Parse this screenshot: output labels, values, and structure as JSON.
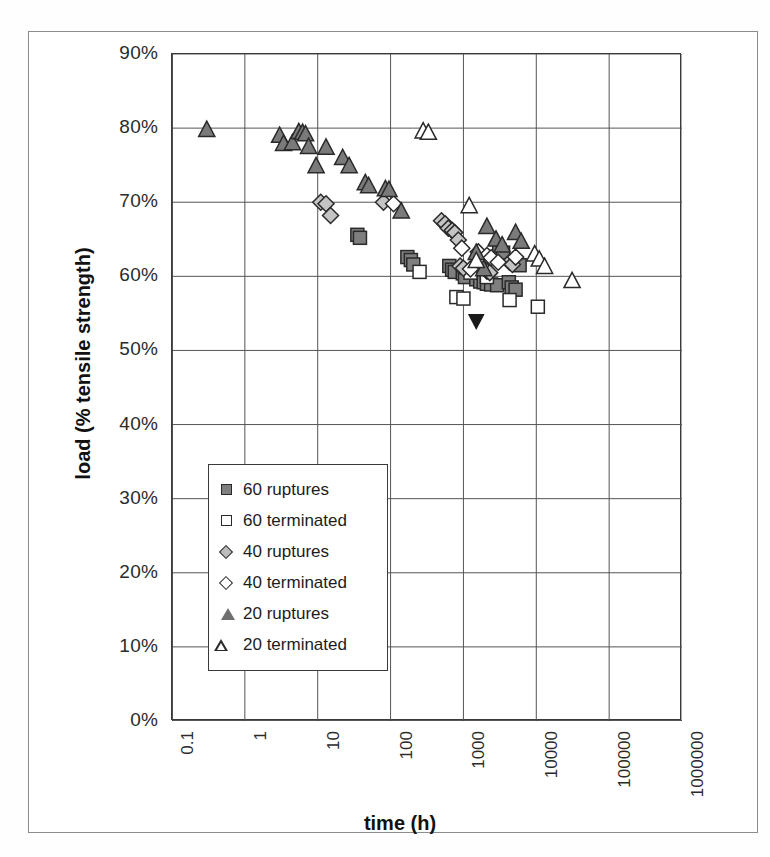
{
  "chart_data": {
    "type": "scatter",
    "title": "",
    "xlabel": "time (h)",
    "ylabel": "load (% tensile strength)",
    "xscale": "log",
    "yscale": "linear",
    "xlim": [
      0.1,
      1000000
    ],
    "ylim": [
      0,
      0.9
    ],
    "grid": true,
    "legend_position": "inside-left-lower",
    "xticklabels": [
      "0.1",
      "1",
      "10",
      "100",
      "1000",
      "10000",
      "100000",
      "1000000"
    ],
    "xtickvalues": [
      0.1,
      1,
      10,
      100,
      1000,
      10000,
      100000,
      1000000
    ],
    "yticklabels": [
      "0%",
      "10%",
      "20%",
      "30%",
      "40%",
      "50%",
      "60%",
      "70%",
      "80%",
      "90%"
    ],
    "ytickvalues": [
      0,
      10,
      20,
      30,
      40,
      50,
      60,
      70,
      80,
      90
    ],
    "series": [
      {
        "name": "60 ruptures",
        "marker": "square-filled",
        "color": "#7f7f7f",
        "edge": "#2a2a2a",
        "points": [
          [
            35,
            65.6
          ],
          [
            38,
            65.2
          ],
          [
            170,
            62.6
          ],
          [
            190,
            62.2
          ],
          [
            205,
            61.6
          ],
          [
            640,
            61.4
          ],
          [
            700,
            60.9
          ],
          [
            760,
            60.6
          ],
          [
            980,
            60.4
          ],
          [
            1050,
            59.9
          ],
          [
            1500,
            59.6
          ],
          [
            1700,
            59.3
          ],
          [
            1900,
            59.2
          ],
          [
            2100,
            59.0
          ],
          [
            2400,
            58.9
          ],
          [
            2900,
            58.8
          ],
          [
            4200,
            59.2
          ],
          [
            4600,
            58.5
          ],
          [
            5200,
            58.2
          ],
          [
            3100,
            63.6
          ],
          [
            3500,
            63.2
          ],
          [
            5300,
            61.8
          ],
          [
            5900,
            61.5
          ]
        ]
      },
      {
        "name": "60 terminated",
        "marker": "square-open",
        "color": "#ffffff",
        "edge": "#2a2a2a",
        "points": [
          [
            250,
            60.6
          ],
          [
            800,
            57.2
          ],
          [
            1000,
            57.0
          ],
          [
            1250,
            60.5
          ],
          [
            2100,
            59.9
          ],
          [
            4300,
            56.8
          ],
          [
            10500,
            55.9
          ]
        ]
      },
      {
        "name": "40 ruptures",
        "marker": "diamond-filled",
        "color": "#c4c4c4",
        "edge": "#2a2a2a",
        "points": [
          [
            11,
            70.0
          ],
          [
            13,
            69.8
          ],
          [
            15,
            68.2
          ],
          [
            80,
            70.0
          ],
          [
            500,
            67.5
          ],
          [
            560,
            67.1
          ],
          [
            620,
            66.5
          ],
          [
            700,
            66.2
          ],
          [
            760,
            65.9
          ],
          [
            850,
            64.9
          ],
          [
            900,
            61.4
          ],
          [
            1000,
            61.1
          ],
          [
            2100,
            60.7
          ],
          [
            2300,
            60.5
          ],
          [
            4300,
            61.9
          ],
          [
            4700,
            61.6
          ]
        ]
      },
      {
        "name": "40 terminated",
        "marker": "diamond-open",
        "color": "#ffffff",
        "edge": "#2a2a2a",
        "points": [
          [
            110,
            69.8
          ],
          [
            950,
            63.8
          ],
          [
            1600,
            63.3
          ],
          [
            2100,
            62.8
          ],
          [
            2400,
            62.5
          ],
          [
            3000,
            61.9
          ],
          [
            1250,
            61.0
          ],
          [
            5200,
            62.6
          ]
        ]
      },
      {
        "name": "20 ruptures",
        "marker": "triangle-filled",
        "color": "#7a7a7a",
        "edge": "#2a2a2a",
        "points": [
          [
            0.3,
            79.8
          ],
          [
            3.0,
            79.0
          ],
          [
            3.4,
            77.9
          ],
          [
            4.5,
            78.0
          ],
          [
            5.5,
            79.5
          ],
          [
            6.2,
            79.4
          ],
          [
            6.8,
            79.2
          ],
          [
            7.5,
            77.5
          ],
          [
            9.5,
            74.9
          ],
          [
            13,
            77.4
          ],
          [
            22,
            76.0
          ],
          [
            27,
            74.9
          ],
          [
            45,
            72.6
          ],
          [
            50,
            72.2
          ],
          [
            85,
            71.8
          ],
          [
            140,
            68.8
          ],
          [
            95,
            71.7
          ],
          [
            2100,
            66.7
          ],
          [
            2800,
            65.0
          ],
          [
            3400,
            64.2
          ],
          [
            5200,
            65.9
          ],
          [
            6200,
            64.7
          ],
          [
            1500,
            63.2
          ],
          [
            1900,
            61.0
          ]
        ]
      },
      {
        "name": "20 terminated",
        "marker": "triangle-open",
        "color": "#ffffff",
        "edge": "#2a2a2a",
        "points": [
          [
            280,
            79.6
          ],
          [
            330,
            79.4
          ],
          [
            1500,
            62.1
          ],
          [
            9500,
            63.0
          ],
          [
            11000,
            62.3
          ],
          [
            13000,
            61.3
          ],
          [
            31000,
            59.4
          ],
          [
            1200,
            69.5
          ]
        ]
      },
      {
        "name": "outlier",
        "marker": "triangle-down-filled",
        "color": "#1a1a1a",
        "edge": "#1a1a1a",
        "points": [
          [
            1500,
            54.0
          ]
        ]
      }
    ]
  },
  "legend": {
    "items": [
      {
        "label": "60 ruptures",
        "marker": "square-filled"
      },
      {
        "label": "60 terminated",
        "marker": "square-open"
      },
      {
        "label": "40 ruptures",
        "marker": "diamond-filled"
      },
      {
        "label": "40 terminated",
        "marker": "diamond-open"
      },
      {
        "label": "20 ruptures",
        "marker": "triangle-filled"
      },
      {
        "label": "20 terminated",
        "marker": "triangle-open"
      }
    ]
  },
  "axes": {
    "x_title": "time (h)",
    "y_title": "load (% tensile strength)"
  },
  "colors": {
    "axis": "#3a3a3a",
    "grid": "#555555",
    "frame": "#8d8d8d",
    "text": "#1c1c1c",
    "marker_fill_grey": "#7f7f7f",
    "marker_fill_light": "#c4c4c4",
    "marker_edge": "#2a2a2a",
    "background": "#ffffff"
  }
}
